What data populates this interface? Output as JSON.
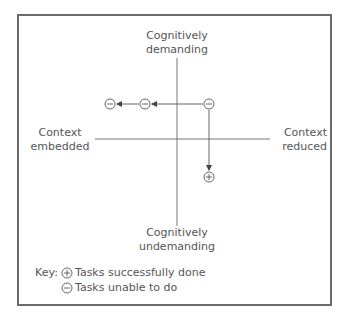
{
  "diagram": {
    "axes": {
      "top": [
        "Cognitively",
        "demanding"
      ],
      "bottom": [
        "Cognitively",
        "undemanding"
      ],
      "left": [
        "Context",
        "embedded"
      ],
      "right": [
        "Context",
        "reduced"
      ]
    },
    "nodes": [
      {
        "symbol": "minus",
        "meaning": "Tasks unable to do",
        "x": 110,
        "y": 104
      },
      {
        "symbol": "minus",
        "meaning": "Tasks unable to do",
        "x": 145,
        "y": 104
      },
      {
        "symbol": "minus",
        "meaning": "Tasks unable to do",
        "x": 209,
        "y": 104
      },
      {
        "symbol": "plus",
        "meaning": "Tasks successfully done",
        "x": 209,
        "y": 177
      }
    ],
    "key": {
      "label": "Key:",
      "items": [
        {
          "symbol": "plus-circle-icon",
          "text": "Tasks successfully done"
        },
        {
          "symbol": "minus-circle-icon",
          "text": "Tasks unable to do"
        }
      ]
    },
    "colors": {
      "line": "#666666",
      "text": "#555555",
      "frame": "#6a6a6a"
    }
  }
}
